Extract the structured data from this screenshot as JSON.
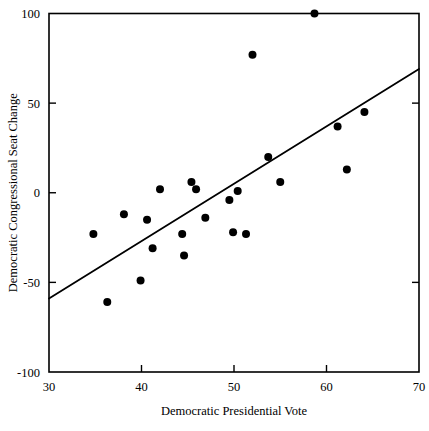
{
  "chart_data": {
    "type": "scatter",
    "title": "",
    "xlabel": "Democratic Presidential Vote",
    "ylabel": "Democratic Congressional Seat Change",
    "xlim": [
      30,
      70
    ],
    "ylim": [
      -100,
      100
    ],
    "xticks": [
      30,
      40,
      50,
      60,
      70
    ],
    "yticks": [
      -100,
      -50,
      0,
      50,
      100
    ],
    "xtick_labels": [
      "30",
      "40",
      "50",
      "60",
      "70"
    ],
    "ytick_labels": [
      "-100",
      "-50",
      "0",
      "50",
      "100"
    ],
    "grid": false,
    "legend": null,
    "marker": "filled-circle",
    "marker_color": "#000000",
    "points": [
      {
        "x": 34.8,
        "y": -23
      },
      {
        "x": 36.3,
        "y": -61
      },
      {
        "x": 38.1,
        "y": -12
      },
      {
        "x": 39.9,
        "y": -49
      },
      {
        "x": 40.6,
        "y": -15
      },
      {
        "x": 41.2,
        "y": -31
      },
      {
        "x": 42.0,
        "y": 2
      },
      {
        "x": 44.4,
        "y": -23
      },
      {
        "x": 44.6,
        "y": -35
      },
      {
        "x": 45.4,
        "y": 6
      },
      {
        "x": 45.9,
        "y": 2
      },
      {
        "x": 46.9,
        "y": -14
      },
      {
        "x": 49.5,
        "y": -4
      },
      {
        "x": 49.9,
        "y": -22
      },
      {
        "x": 50.4,
        "y": 1
      },
      {
        "x": 51.3,
        "y": -23
      },
      {
        "x": 52.0,
        "y": 77
      },
      {
        "x": 53.7,
        "y": 20
      },
      {
        "x": 55.0,
        "y": 6
      },
      {
        "x": 58.7,
        "y": 100
      },
      {
        "x": 61.2,
        "y": 37
      },
      {
        "x": 62.2,
        "y": 13
      },
      {
        "x": 64.1,
        "y": 45
      }
    ],
    "fit_line": {
      "label": "regression-line",
      "x_start": 30,
      "y_start": -59,
      "x_end": 70,
      "y_end": 69
    }
  }
}
